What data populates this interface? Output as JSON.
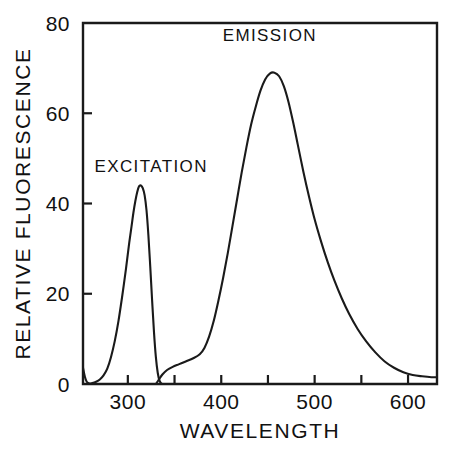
{
  "chart_data": {
    "type": "line",
    "title": "",
    "xlabel": "WAVELENGTH",
    "ylabel": "RELATIVE FLUORESCENCE",
    "xlim": [
      252,
      631
    ],
    "ylim": [
      0,
      80
    ],
    "xticks": [
      300,
      400,
      500,
      600
    ],
    "xtick_labels": [
      "300",
      "400",
      "500",
      "600"
    ],
    "xminorticks": [
      350,
      450,
      550
    ],
    "yticks": [
      0,
      20,
      40,
      60,
      80
    ],
    "ytick_labels": [
      "0",
      "20",
      "40",
      "60",
      "80"
    ],
    "grid": false,
    "legend_position": "inline-annotations",
    "annotations": [
      {
        "text": "EXCITATION",
        "x": 325,
        "y": 47
      },
      {
        "text": "EMISSION",
        "x": 452,
        "y": 76
      }
    ],
    "series": [
      {
        "name": "EXCITATION",
        "label": "EXCITATION",
        "color": "#1a1a1a",
        "points": [
          [
            252,
            3.6
          ],
          [
            254,
            1.6
          ],
          [
            256,
            0.5
          ],
          [
            259,
            0.1
          ],
          [
            262,
            0.2
          ],
          [
            266,
            0.5
          ],
          [
            270,
            1.0
          ],
          [
            274,
            1.9
          ],
          [
            278,
            3.4
          ],
          [
            282,
            6.0
          ],
          [
            286,
            9.5
          ],
          [
            290,
            14.0
          ],
          [
            294,
            19.5
          ],
          [
            298,
            25.5
          ],
          [
            301,
            30.5
          ],
          [
            304,
            35.0
          ],
          [
            306,
            38.0
          ],
          [
            308,
            40.5
          ],
          [
            310,
            42.5
          ],
          [
            312,
            43.8
          ],
          [
            314,
            44.0
          ],
          [
            316,
            43.4
          ],
          [
            318,
            41.8
          ],
          [
            320,
            38.5
          ],
          [
            322,
            33.0
          ],
          [
            324,
            26.0
          ],
          [
            326,
            18.5
          ],
          [
            328,
            11.5
          ],
          [
            330,
            6.0
          ],
          [
            332,
            2.5
          ],
          [
            334,
            0.7
          ],
          [
            336,
            0.1
          ],
          [
            337,
            0.0
          ]
        ]
      },
      {
        "name": "EMISSION",
        "label": "EMISSION",
        "color": "#1a1a1a",
        "points": [
          [
            330,
            0.0
          ],
          [
            333,
            0.9
          ],
          [
            337,
            2.1
          ],
          [
            342,
            3.1
          ],
          [
            348,
            3.8
          ],
          [
            355,
            4.4
          ],
          [
            362,
            5.0
          ],
          [
            370,
            5.7
          ],
          [
            377,
            6.6
          ],
          [
            382,
            8.0
          ],
          [
            387,
            10.5
          ],
          [
            392,
            14.0
          ],
          [
            397,
            18.5
          ],
          [
            402,
            23.5
          ],
          [
            407,
            29.0
          ],
          [
            412,
            35.0
          ],
          [
            417,
            41.0
          ],
          [
            422,
            47.0
          ],
          [
            427,
            52.5
          ],
          [
            432,
            57.5
          ],
          [
            437,
            61.5
          ],
          [
            442,
            65.0
          ],
          [
            447,
            67.5
          ],
          [
            452,
            68.8
          ],
          [
            457,
            69.0
          ],
          [
            462,
            68.2
          ],
          [
            467,
            66.0
          ],
          [
            472,
            62.5
          ],
          [
            477,
            58.0
          ],
          [
            482,
            53.0
          ],
          [
            488,
            47.0
          ],
          [
            494,
            41.5
          ],
          [
            500,
            36.5
          ],
          [
            507,
            31.5
          ],
          [
            514,
            27.0
          ],
          [
            521,
            23.0
          ],
          [
            529,
            19.0
          ],
          [
            537,
            15.5
          ],
          [
            546,
            12.2
          ],
          [
            555,
            9.5
          ],
          [
            565,
            7.0
          ],
          [
            575,
            5.0
          ],
          [
            585,
            3.6
          ],
          [
            595,
            2.6
          ],
          [
            605,
            2.0
          ],
          [
            615,
            1.7
          ],
          [
            625,
            1.5
          ],
          [
            631,
            1.5
          ]
        ]
      }
    ]
  },
  "figure": {
    "caption_fragment": "caption text cropped at page edge"
  }
}
